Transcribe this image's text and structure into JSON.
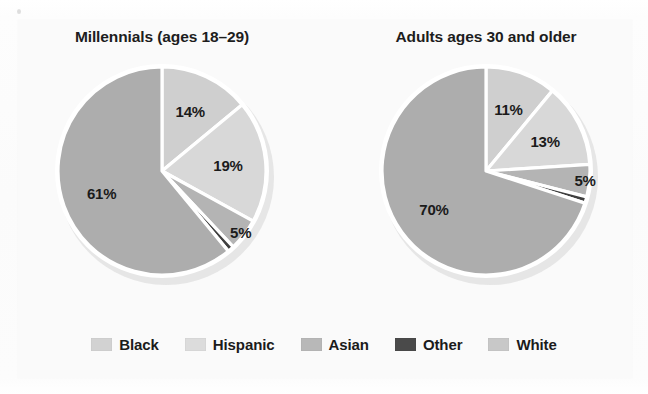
{
  "figure": {
    "background_color": "#fafafa",
    "slice_border_color": "#ffffff"
  },
  "chart_data": {
    "type": "pie",
    "title": "",
    "charts": [
      {
        "title": "Millennials (ages 18–29)",
        "categories": [
          "Black",
          "Hispanic",
          "Asian",
          "Other",
          "White"
        ],
        "values": [
          14,
          19,
          5,
          1,
          61
        ],
        "labels": [
          "14%",
          "19%",
          "5%",
          "",
          "61%"
        ],
        "start_angle_deg": 0,
        "direction": "clockwise"
      },
      {
        "title": "Adults ages 30 and older",
        "categories": [
          "Black",
          "Hispanic",
          "Asian",
          "Other",
          "White"
        ],
        "values": [
          11,
          13,
          5,
          1,
          70
        ],
        "labels": [
          "11%",
          "13%",
          "5%",
          "",
          "70%"
        ],
        "start_angle_deg": 0,
        "direction": "clockwise"
      }
    ],
    "legend": {
      "position": "bottom",
      "entries": [
        {
          "label": "Black",
          "color": "#d2d2d2"
        },
        {
          "label": "Hispanic",
          "color": "#dcdcdc"
        },
        {
          "label": "Asian",
          "color": "#b8b8b8"
        },
        {
          "label": "Other",
          "color": "#4a4a4a"
        },
        {
          "label": "White",
          "color": "#c8c8c8"
        }
      ]
    },
    "slice_colors": {
      "Black": "#cfcfcf",
      "Hispanic": "#d8d8d8",
      "Asian": "#b4b4b4",
      "Other": "#3f3f3f",
      "White": "#adadad"
    },
    "xlabel": "",
    "ylabel": "",
    "grid": false
  }
}
